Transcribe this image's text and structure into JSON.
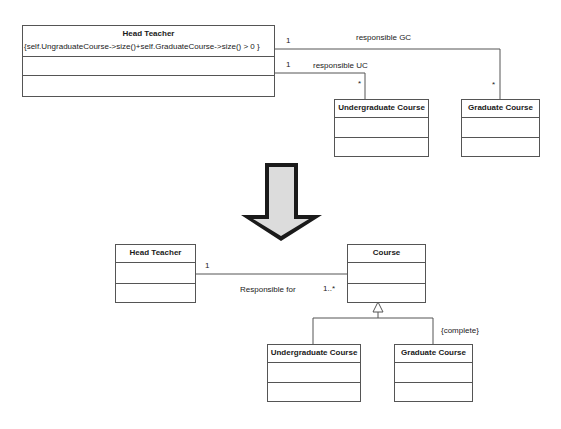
{
  "before": {
    "head_teacher": {
      "name": "Head Teacher",
      "constraint": "{self.UngraduateCourse->size()+self.GraduateCourse->size() > 0  }"
    },
    "undergraduate_course": {
      "name": "Undergraduate Course"
    },
    "graduate_course": {
      "name": "Graduate Course"
    },
    "assoc_gc": {
      "label": "responsible GC",
      "source_mult": "1",
      "target_mult": "*"
    },
    "assoc_uc": {
      "label": "responsible UC",
      "source_mult": "1",
      "target_mult": "*"
    }
  },
  "arrow": {
    "icon": "down-arrow-icon",
    "meaning": "transformation"
  },
  "after": {
    "head_teacher": {
      "name": "Head Teacher"
    },
    "course": {
      "name": "Course"
    },
    "undergraduate_course": {
      "name": "Undergraduate Course"
    },
    "graduate_course": {
      "name": "Graduate Course"
    },
    "assoc": {
      "label": "Responsible for",
      "source_mult": "1",
      "target_mult": "1..*"
    },
    "generalization_constraint": "{complete}"
  }
}
